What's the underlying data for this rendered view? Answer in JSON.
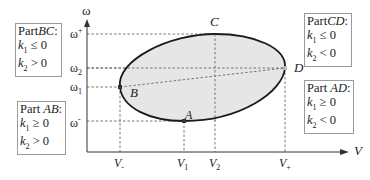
{
  "axes": {
    "y_label": "ω",
    "x_label": "V",
    "y_ticks": [
      {
        "name": "omega-plus",
        "base": "ω",
        "sup": "+",
        "sub": ""
      },
      {
        "name": "omega-2",
        "base": "ω",
        "sup": "",
        "sub": "2"
      },
      {
        "name": "omega-1",
        "base": "ω",
        "sup": "",
        "sub": "1"
      },
      {
        "name": "omega-minus",
        "base": "ω",
        "sup": "-",
        "sub": ""
      }
    ],
    "x_ticks": [
      {
        "name": "v-minus",
        "base": "V",
        "sub": "-"
      },
      {
        "name": "v-1",
        "base": "V",
        "sub": "1"
      },
      {
        "name": "v-2",
        "base": "V",
        "sub": "2"
      },
      {
        "name": "v-plus",
        "base": "V",
        "sub": "+"
      }
    ]
  },
  "points": {
    "A": "A",
    "B": "B",
    "C": "C",
    "D": "D"
  },
  "boxes": {
    "bc": {
      "prefix": "Part",
      "part": "BC",
      "suffix": ":",
      "k1": "k",
      "k1_sub": "1",
      "k1_rel": " ≤ 0",
      "k2": "k",
      "k2_sub": "2",
      "k2_rel": " > 0"
    },
    "cd": {
      "prefix": "Part",
      "part": "CD",
      "suffix": ":",
      "k1": "k",
      "k1_sub": "1",
      "k1_rel": " ≤ 0",
      "k2": "k",
      "k2_sub": "2",
      "k2_rel": " < 0"
    },
    "ab": {
      "prefix": "Part ",
      "part": "AB",
      "suffix": ":",
      "k1": "k",
      "k1_sub": "1",
      "k1_rel": " ≥ 0",
      "k2": "k",
      "k2_sub": "2",
      "k2_rel": " > 0"
    },
    "ad": {
      "prefix": "Part ",
      "part": "AD",
      "suffix": ":",
      "k1": "k",
      "k1_sub": "1",
      "k1_rel": " ≥ 0",
      "k2": "k",
      "k2_sub": "2",
      "k2_rel": " < 0"
    }
  },
  "colors": {
    "ellipse_fill": "#e6e6e6",
    "ellipse_stroke": "#1a1a1a",
    "axis": "#333333",
    "dashed": "#555555",
    "box_border": "#9a9a9a"
  }
}
